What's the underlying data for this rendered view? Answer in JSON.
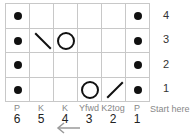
{
  "chart": {
    "rows": [
      {
        "number": "4",
        "cells": [
          "purl",
          "knit",
          "knit",
          "knit",
          "knit",
          "purl"
        ]
      },
      {
        "number": "3",
        "cells": [
          "purl",
          "ssk",
          "yfwd",
          "knit",
          "knit",
          "purl"
        ]
      },
      {
        "number": "2",
        "cells": [
          "purl",
          "knit",
          "knit",
          "knit",
          "knit",
          "purl"
        ]
      },
      {
        "number": "1",
        "cells": [
          "purl",
          "knit",
          "knit",
          "yfwd",
          "k2tog",
          "purl"
        ]
      }
    ],
    "columns": [
      {
        "stitch": "P",
        "number": "6"
      },
      {
        "stitch": "K",
        "number": "5"
      },
      {
        "stitch": "K",
        "number": "4"
      },
      {
        "stitch": "Yfwd",
        "number": "3"
      },
      {
        "stitch": "K2tog",
        "number": "2"
      },
      {
        "stitch": "P",
        "number": "1"
      }
    ],
    "start_label": "Start here",
    "direction_icon": "arrow-left-icon",
    "colors": {
      "grid_line": "#c8c8c8",
      "symbol": "#111111",
      "label": "#888888",
      "arrow": "#9a9a9a"
    }
  }
}
